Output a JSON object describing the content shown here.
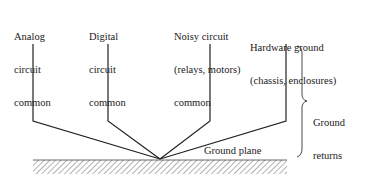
{
  "diagram": {
    "type": "single-point ground (star) schematic",
    "sources": [
      {
        "id": "analog",
        "lines": [
          "Analog",
          "circuit",
          "common"
        ]
      },
      {
        "id": "digital",
        "lines": [
          "Digital",
          "circuit",
          "common"
        ]
      },
      {
        "id": "noisy",
        "lines": [
          "Noisy circuit",
          "(relays, motors)",
          "common"
        ]
      },
      {
        "id": "hardware",
        "lines": [
          "Hardware ground",
          "(chassis, enclosures)"
        ]
      }
    ],
    "ground_plane_label": "Ground plane",
    "brace_label": [
      "Ground",
      "returns"
    ],
    "colors": {
      "line": "#222222",
      "text": "#1a1a1a",
      "background": "#ffffff"
    }
  }
}
